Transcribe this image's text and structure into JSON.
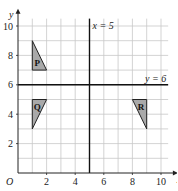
{
  "diagram": {
    "x_axis": {
      "label": "x",
      "min": 0,
      "max": 10.5,
      "ticks": [
        2,
        4,
        6,
        8,
        10
      ]
    },
    "y_axis": {
      "label": "y",
      "min": 0,
      "max": 10.5,
      "ticks": [
        2,
        4,
        6,
        8,
        10
      ]
    },
    "origin_label": "O",
    "grid": true,
    "lines": [
      {
        "id": "x5",
        "label": "x = 5",
        "type": "vertical",
        "value": 5
      },
      {
        "id": "y6",
        "label": "y = 6",
        "type": "horizontal",
        "value": 6
      }
    ],
    "shapes": [
      {
        "label": "P",
        "vertices": [
          [
            1,
            7
          ],
          [
            2,
            7
          ],
          [
            1,
            9
          ]
        ],
        "label_at": [
          1.35,
          7.5
        ]
      },
      {
        "label": "Q",
        "vertices": [
          [
            1,
            5
          ],
          [
            2,
            5
          ],
          [
            1,
            3
          ]
        ],
        "label_at": [
          1.35,
          4.5
        ]
      },
      {
        "label": "R",
        "vertices": [
          [
            8,
            5
          ],
          [
            9,
            5
          ],
          [
            9,
            3
          ]
        ],
        "label_at": [
          8.6,
          4.5
        ]
      }
    ],
    "colors": {
      "shape_fill": "#a9a9a9",
      "grid": "#c8c8c8",
      "axis": "#222222"
    }
  }
}
